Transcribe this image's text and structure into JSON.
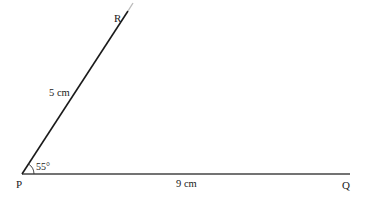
{
  "diagram": {
    "type": "triangle-construction",
    "points": {
      "P": {
        "label": "P"
      },
      "Q": {
        "label": "Q"
      },
      "R": {
        "label": "R"
      }
    },
    "segments": [
      {
        "from": "P",
        "to": "R",
        "length_label": "5 cm"
      },
      {
        "from": "P",
        "to": "Q",
        "length_label": "9 cm"
      }
    ],
    "angle": {
      "vertex": "P",
      "label": "55°"
    }
  },
  "colors": {
    "line": "#222222",
    "text": "#1a1a1a"
  }
}
